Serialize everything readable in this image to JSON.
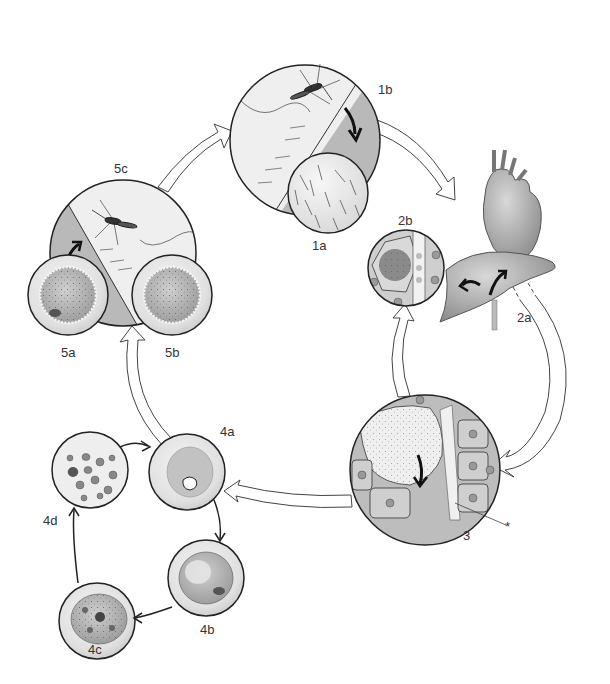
{
  "diagram": {
    "type": "life-cycle",
    "stages": [
      {
        "id": "1a",
        "label": "1a",
        "description": "close-up of skin surface with hairs"
      },
      {
        "id": "1b",
        "label": "1b",
        "description": "mosquito biting skin, arrow into skin"
      },
      {
        "id": "2a",
        "label": "2a",
        "description": "heart and liver with arrows"
      },
      {
        "id": "2b",
        "label": "2b",
        "description": "liver tissue close-up with infected hepatocyte"
      },
      {
        "id": "3",
        "label": "3",
        "description": "liver cells with large schizont releasing merozoites into sinusoid"
      },
      {
        "id": "4a",
        "label": "4a",
        "description": "red blood cell with ring stage"
      },
      {
        "id": "4b",
        "label": "4b",
        "description": "red blood cell with trophozoite"
      },
      {
        "id": "4c",
        "label": "4c",
        "description": "red blood cell with schizont"
      },
      {
        "id": "4d",
        "label": "4d",
        "description": "rupturing cell releasing merozoites"
      },
      {
        "id": "5a",
        "label": "5a",
        "description": "gametocyte in red blood cell"
      },
      {
        "id": "5b",
        "label": "5b",
        "description": "gametocyte in red blood cell"
      },
      {
        "id": "5c",
        "label": "5c",
        "description": "mosquito taking blood meal"
      }
    ],
    "asterisk_label": "*",
    "flow": [
      "1b",
      "2a",
      "3",
      "4a",
      "4b",
      "4c",
      "4d",
      "4a",
      "5c",
      "1b"
    ],
    "colors": {
      "outline": "#222222",
      "skin_shade": "#b8b8b8",
      "skin_light": "#ececec",
      "cell_fill": "#c9c9c9",
      "cell_light": "#e6e6e6",
      "arrow_outline": "#444444"
    }
  }
}
